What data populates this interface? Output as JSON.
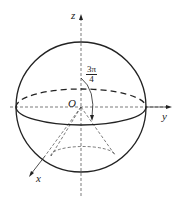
{
  "diagram": {
    "type": "sphere with inscribed cone in 3D coordinate axes",
    "labels": {
      "z_axis": "z",
      "y_axis": "y",
      "x_axis": "x",
      "origin": "O",
      "angle_num": "3π",
      "angle_den": "4"
    },
    "colors": {
      "stroke": "#222222",
      "background": "#ffffff"
    }
  }
}
